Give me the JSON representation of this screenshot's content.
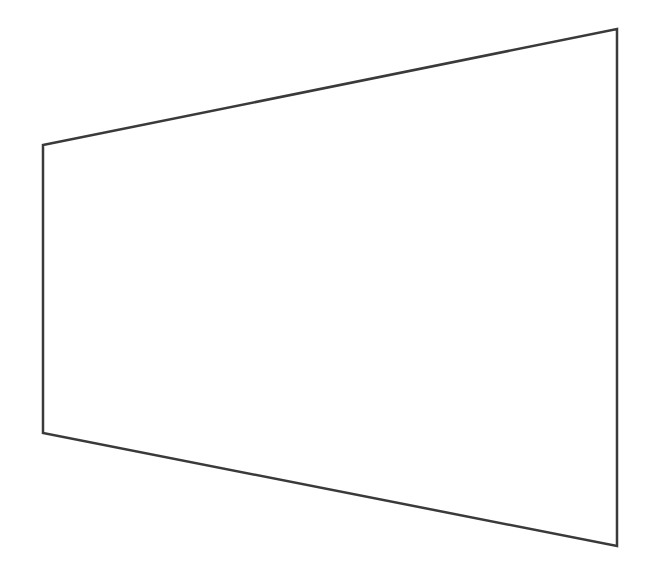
{
  "figure": {
    "width": 661,
    "height": 577,
    "background": "#ffffff",
    "shape": {
      "type": "quadrilateral",
      "description": "trapezoid in perspective",
      "stroke": "#3a3a3a",
      "stroke_width": 2.5,
      "fill": "none",
      "points": [
        [
          43,
          145
        ],
        [
          617,
          29
        ],
        [
          617,
          546
        ],
        [
          43,
          433
        ]
      ]
    }
  }
}
